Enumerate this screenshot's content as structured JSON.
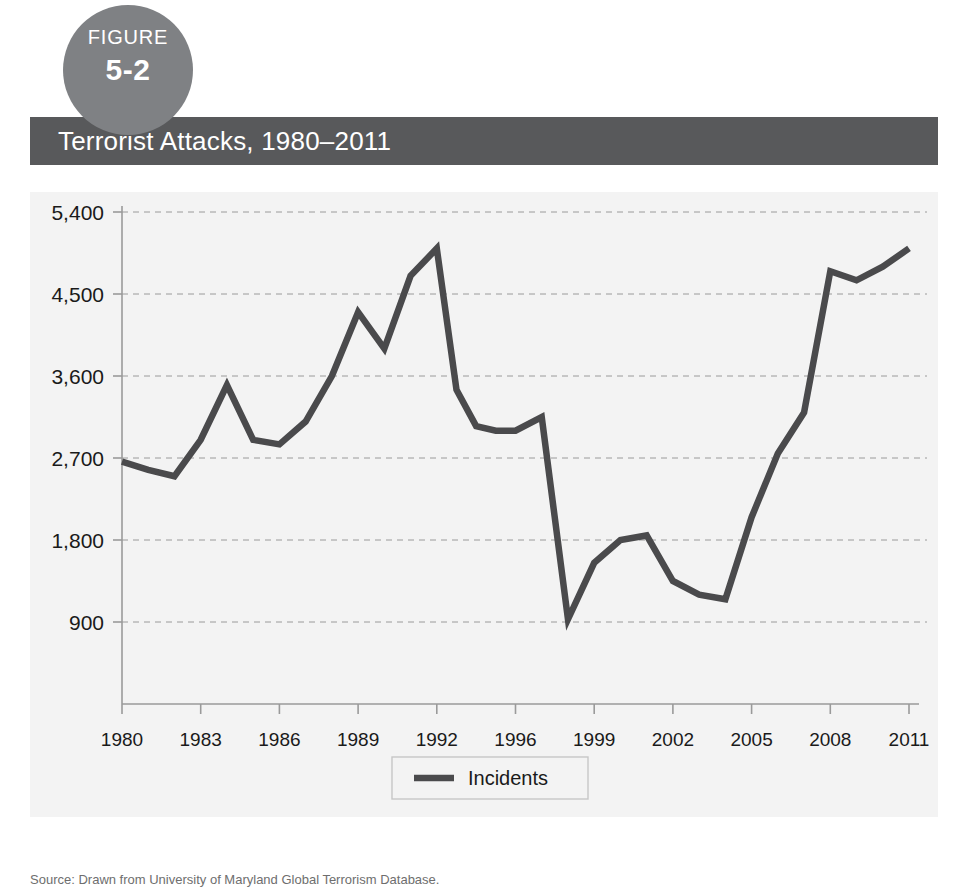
{
  "figure": {
    "label": "FIGURE",
    "number": "5-2"
  },
  "title": "Terrorist Attacks, 1980–2011",
  "source": {
    "label": "Source:",
    "text": "Drawn from University of Maryland Global Terrorism Database."
  },
  "colors": {
    "badge": "#7f8184",
    "title_bar": "#58595b",
    "panel_bg": "#f3f3f3",
    "line": "#4a4a4c",
    "grid": "#9a9a9a",
    "text": "#1a1a1a"
  },
  "chart_data": {
    "type": "line",
    "title": "Terrorist Attacks, 1980–2011",
    "xlabel": "",
    "ylabel": "",
    "xlim": [
      1980,
      2011
    ],
    "ylim": [
      0,
      5400
    ],
    "grid": true,
    "legend_position": "bottom",
    "ytick_labels": [
      "900",
      "1,800",
      "2,700",
      "3,600",
      "4,500",
      "5,400"
    ],
    "ytick_values": [
      900,
      1800,
      2700,
      3600,
      4500,
      5400
    ],
    "xtick_labels": [
      "1980",
      "1983",
      "1986",
      "1989",
      "1992",
      "1996",
      "1999",
      "2002",
      "2005",
      "2008",
      "2011"
    ],
    "xtick_values": [
      1980,
      1983,
      1986,
      1989,
      1992,
      1996,
      1999,
      2002,
      2005,
      2008,
      2011
    ],
    "series": [
      {
        "name": "Incidents",
        "x": [
          1980,
          1981,
          1982,
          1983,
          1984,
          1985,
          1986,
          1987,
          1988,
          1989,
          1990,
          1991,
          1992,
          1993,
          1994,
          1995,
          1996,
          1997,
          1998,
          1999,
          2000,
          2001,
          2002,
          2003,
          2004,
          2005,
          2006,
          2007,
          2008,
          2009,
          2010,
          2011
        ],
        "values": [
          2660,
          2570,
          2500,
          2900,
          3500,
          2900,
          2850,
          3100,
          3600,
          4300,
          3900,
          4700,
          5000,
          3450,
          3050,
          3000,
          3000,
          3150,
          930,
          1550,
          1800,
          1850,
          1350,
          1200,
          1150,
          2050,
          2750,
          3200,
          4750,
          4650,
          4800,
          5000
        ]
      }
    ],
    "legend": [
      {
        "label": "Incidents",
        "color": "#4a4a4c"
      }
    ]
  }
}
